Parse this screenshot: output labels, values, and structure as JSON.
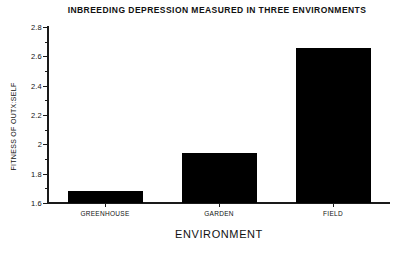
{
  "chart_data": {
    "type": "bar",
    "title": "INBREEDING DEPRESSION MEASURED IN THREE ENVIRONMENTS",
    "xlabel": "ENVIRONMENT",
    "ylabel": "FITNESS OF OUTX:SELF",
    "categories": [
      "GREENHOUSE",
      "GARDEN",
      "FIELD"
    ],
    "values": [
      1.68,
      1.94,
      2.66
    ],
    "ylim": [
      1.6,
      2.8
    ],
    "ytick_labels": [
      "2.8",
      "2.6",
      "2.4",
      "2.2",
      "2",
      "1.8",
      "1.6"
    ],
    "ytick_values": [
      2.8,
      2.6,
      2.4,
      2.2,
      2.0,
      1.8,
      1.6
    ],
    "yminor_values": [
      2.7,
      2.5,
      2.3,
      2.1,
      1.9,
      1.7
    ],
    "grid": false,
    "legend": null,
    "bar_color": "#000000",
    "axis_color": "#1a1a1a",
    "background_color": "#ffffff"
  }
}
